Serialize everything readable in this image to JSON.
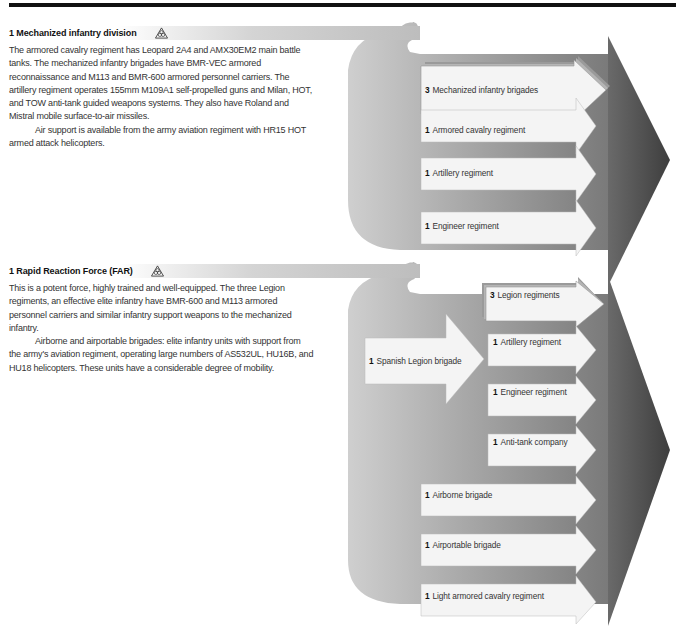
{
  "sections": [
    {
      "count": "1",
      "title": "Mechanized infantry division",
      "icon": "nbc-trefoil-triangle-icon",
      "paragraphs": [
        "The armored cavalry regiment has Leopard 2A4 and AMX30EM2 main battle tanks. The mechanized infantry brigades have BMR-VEC armored reconnaissance and M113 and BMR-600 armored personnel carriers. The artillery regiment operates 155mm M109A1 self-propelled guns and Milan, HOT, and TOW anti-tank guided weapons systems. They also have Roland and Mistral mobile surface-to-air missiles.",
        "Air support is available from the army aviation regiment with HR15 HOT armed attack helicopters."
      ],
      "units": [
        {
          "count": "3",
          "label": "Mechanized infantry brigades"
        },
        {
          "count": "1",
          "label": "Armored cavalry regiment"
        },
        {
          "count": "1",
          "label": "Artillery regiment"
        },
        {
          "count": "1",
          "label": "Engineer regiment"
        }
      ]
    },
    {
      "count": "1",
      "title": "Rapid Reaction Force (FAR)",
      "icon": "nbc-trefoil-triangle-icon",
      "paragraphs": [
        "This is a potent force, highly trained and well-equipped. The three Legion regiments, an effective elite infantry have BMR-600 and M113 armored personnel carriers and similar infantry support weapons to the mechanized infantry.",
        "Airborne and airportable brigades: elite infantry units with support from the army's aviation regiment, operating large numbers of AS532UL, HU16B, and HU18 helicopters. These units have a considerable degree of mobility."
      ],
      "sub_unit": {
        "count": "1",
        "label": "Spanish Legion brigade"
      },
      "legion_units": [
        {
          "count": "3",
          "label": "Legion regiments"
        },
        {
          "count": "1",
          "label": "Artillery regiment"
        },
        {
          "count": "1",
          "label": "Engineer regiment"
        },
        {
          "count": "1",
          "label": "Anti-tank company"
        }
      ],
      "units": [
        {
          "count": "1",
          "label": "Airborne brigade"
        },
        {
          "count": "1",
          "label": "Airportable brigade"
        },
        {
          "count": "1",
          "label": "Light armored cavalry regiment"
        }
      ]
    }
  ],
  "colors": {
    "top_rule": "#111111",
    "flow_light": "#bdbdbd",
    "flow_mid": "#8a8a8a",
    "big_arrow": "#555555",
    "unit_arrow_fill": "#f4f4f4"
  }
}
